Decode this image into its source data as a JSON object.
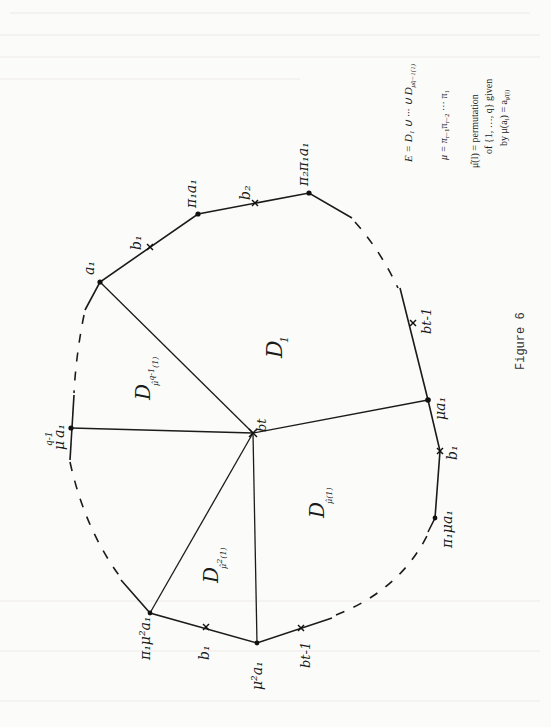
{
  "figure": {
    "caption": "Figure 6",
    "orientation": "rotated-90-ccw"
  },
  "vertices": {
    "center": {
      "label": "b_t",
      "text": "bt",
      "x": 253,
      "y": 433
    },
    "a1": {
      "label": "a1",
      "text": "a₁",
      "x": 100,
      "y": 282
    },
    "pi1_a1": {
      "label": "π1 a1",
      "text": "π₁a₁",
      "x": 198,
      "y": 214
    },
    "pi2_pi1_a1": {
      "label": "π2 π1 a1",
      "text": "π₂π₁a₁",
      "x": 309,
      "y": 193
    },
    "mu_a1": {
      "label": "μ a1",
      "text": "μa₁",
      "x": 428,
      "y": 400
    },
    "pi1_mu_a1": {
      "label": "π1 μ a1",
      "text": "π₁μa₁",
      "x": 435,
      "y": 518
    },
    "mu2_a1": {
      "label": "μ² a1",
      "text": "μ²a₁",
      "x": 257,
      "y": 643
    },
    "pi1_mu2_a1": {
      "label": "π1 μ² a1",
      "text": "π₁μ²a₁",
      "x": 150,
      "y": 613
    },
    "muq1_a1": {
      "label": "μ^(q-1) a1",
      "text": "μ",
      "sup": "q-1",
      "sub": "a₁",
      "x": 71,
      "y": 428
    }
  },
  "crosses": {
    "b1_top": {
      "text": "b₁",
      "x": 150,
      "y": 247
    },
    "b2_top": {
      "text": "b₂",
      "x": 255,
      "y": 203
    },
    "bt1_right": {
      "text": "bt-1",
      "x": 413,
      "y": 323
    },
    "b1_right": {
      "text": "b₁",
      "x": 440,
      "y": 451
    },
    "b1_bottom": {
      "text": "b₁",
      "x": 206,
      "y": 627
    },
    "bt1_bottom": {
      "text": "bt-1",
      "x": 301,
      "y": 628
    }
  },
  "regions": {
    "D1": {
      "text": "D",
      "sub": "1"
    },
    "D_mu_q1": {
      "text": "D",
      "sub": "μ̂ q-1 (1)"
    },
    "D_mu2": {
      "text": "D",
      "sub": "μ̂² (1)"
    },
    "D_mu": {
      "text": "D",
      "sub": "μ̂ (1)"
    }
  },
  "formulas": {
    "E": "E = D₁ ∪ ··· ∪ D_{μ̂^{q−1}(1)}",
    "E_main": "E = D₁ ∪ ··· ∪ D",
    "E_sub": "μ̂q−1(1)",
    "mu": "μ = π_{r−1} π_{r−2} ··· π₁",
    "mu_main": "μ = π",
    "mu_rest": "r−1",
    "mu_pi2": "π",
    "mu_rest2": "r−2",
    "mu_tail": " ··· π₁",
    "perm_line1": "μ̂(l) = permutation",
    "perm_line2": "of {1, …, q} given",
    "perm_line3_main": "by μ(a",
    "perm_line3_l": "l",
    "perm_line3_eq": ") = a",
    "perm_line3_sub": "μ̂(l)"
  }
}
